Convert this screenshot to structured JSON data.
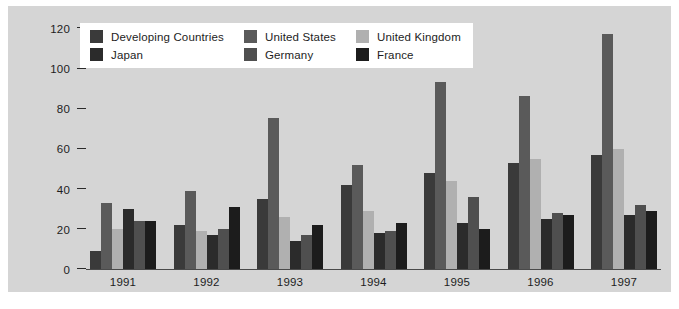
{
  "chart_data": {
    "type": "bar",
    "title": "",
    "xlabel": "",
    "ylabel": "",
    "categories": [
      "1991",
      "1992",
      "1993",
      "1994",
      "1995",
      "1996",
      "1997"
    ],
    "ylim": [
      0,
      120
    ],
    "yticks": [
      0,
      20,
      40,
      60,
      80,
      100,
      120
    ],
    "grid": false,
    "legend_position": "top-left-inside",
    "series": [
      {
        "name": "Developing Countries",
        "color": "#3a3a3a",
        "values": [
          9,
          22,
          35,
          42,
          48,
          53,
          57
        ]
      },
      {
        "name": "United States",
        "color": "#5a5a5a",
        "values": [
          33,
          39,
          75,
          52,
          93,
          86,
          117
        ]
      },
      {
        "name": "United Kingdom",
        "color": "#b0b0b0",
        "values": [
          20,
          19,
          26,
          29,
          44,
          55,
          60
        ]
      },
      {
        "name": "Japan",
        "color": "#2b2b2b",
        "values": [
          30,
          17,
          14,
          18,
          23,
          25,
          27
        ]
      },
      {
        "name": "Germany",
        "color": "#4f4f4f",
        "values": [
          24,
          20,
          17,
          19,
          36,
          28,
          32
        ]
      },
      {
        "name": "France",
        "color": "#1c1c1c",
        "values": [
          24,
          31,
          22,
          23,
          20,
          27,
          29
        ]
      }
    ]
  },
  "legend": {
    "entries": [
      {
        "label": "Developing Countries",
        "color": "#3a3a3a",
        "icon": "legend-swatch-developing-countries"
      },
      {
        "label": "United States",
        "color": "#5a5a5a",
        "icon": "legend-swatch-united-states"
      },
      {
        "label": "United Kingdom",
        "color": "#b0b0b0",
        "icon": "legend-swatch-united-kingdom"
      },
      {
        "label": "Japan",
        "color": "#2b2b2b",
        "icon": "legend-swatch-japan"
      },
      {
        "label": "Germany",
        "color": "#4f4f4f",
        "icon": "legend-swatch-germany"
      },
      {
        "label": "France",
        "color": "#1c1c1c",
        "icon": "legend-swatch-france"
      }
    ]
  },
  "axes": {
    "y_tick_labels": [
      "120",
      "100",
      "80",
      "60",
      "40",
      "20",
      "0"
    ],
    "x_tick_labels": [
      "1991",
      "1992",
      "1993",
      "1994",
      "1995",
      "1996",
      "1997"
    ]
  },
  "colors": {
    "panel_background": "#d5d5d5",
    "page_background": "#ffffff",
    "axis": "#2a2a2a",
    "text": "#1d1d1d",
    "legend_background": "#ffffff"
  }
}
